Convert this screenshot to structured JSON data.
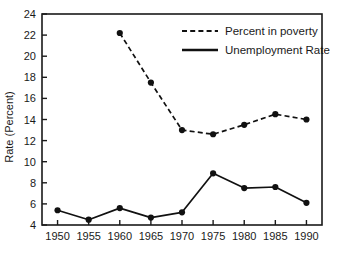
{
  "chart_data": {
    "type": "line",
    "title": "",
    "xlabel": "",
    "ylabel": "Rate (Percent)",
    "x": [
      1950,
      1955,
      1960,
      1965,
      1970,
      1975,
      1980,
      1985,
      1990
    ],
    "xtick_labels": [
      "1950",
      "1955",
      "1960",
      "1965",
      "1970",
      "1975",
      "1980",
      "1985",
      "1990"
    ],
    "ytick_labels": [
      "4",
      "6",
      "8",
      "10",
      "12",
      "14",
      "16",
      "18",
      "20",
      "22",
      "24"
    ],
    "yticks": [
      4,
      6,
      8,
      10,
      12,
      14,
      16,
      18,
      20,
      22,
      24
    ],
    "xlim": [
      1947.5,
      1992.5
    ],
    "ylim": [
      4,
      24
    ],
    "grid": false,
    "legend_position": "top-right",
    "series": [
      {
        "name": "Percent in poverty",
        "style": "dashed",
        "marker": "filled-circle",
        "color": "#111111",
        "x": [
          1960,
          1965,
          1970,
          1975,
          1980,
          1985,
          1990
        ],
        "values": [
          22.2,
          17.5,
          13.0,
          12.6,
          13.5,
          14.5,
          14.0
        ]
      },
      {
        "name": "Unemployment Rate",
        "style": "solid",
        "marker": "filled-circle",
        "color": "#111111",
        "x": [
          1950,
          1955,
          1960,
          1965,
          1970,
          1975,
          1980,
          1985,
          1990
        ],
        "values": [
          5.4,
          4.5,
          5.6,
          4.7,
          5.2,
          8.9,
          7.5,
          7.6,
          6.1
        ]
      }
    ]
  },
  "legend": {
    "items": [
      {
        "label": "Percent in poverty",
        "style": "dashed"
      },
      {
        "label": "Unemployment Rate",
        "style": "solid"
      }
    ]
  },
  "colors": {
    "ink": "#111111",
    "background": "#ffffff",
    "frame": "#1a1a1a"
  }
}
